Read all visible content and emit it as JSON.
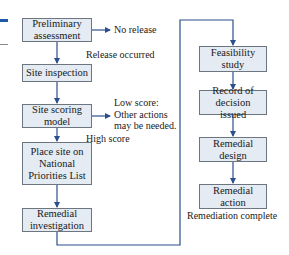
{
  "colors": {
    "box_fill": "#e4ebf2",
    "box_border": "#6d7680",
    "arrow": "#2b4f8c",
    "accent_bar": "#1f5aa6"
  },
  "flowchart": {
    "left_column": [
      {
        "id": "preliminary",
        "label": "Preliminary\nassessment"
      },
      {
        "id": "inspection",
        "label": "Site inspection"
      },
      {
        "id": "scoring",
        "label": "Site scoring\nmodel"
      },
      {
        "id": "npl",
        "label": "Place site on\nNational\nPriorities List"
      },
      {
        "id": "investigation",
        "label": "Remedial\ninvestigation"
      }
    ],
    "right_column": [
      {
        "id": "feasibility",
        "label": "Feasibility\nstudy"
      },
      {
        "id": "record",
        "label": "Record of\ndecision issued"
      },
      {
        "id": "design",
        "label": "Remedial\ndesign"
      },
      {
        "id": "action",
        "label": "Remedial\naction"
      }
    ],
    "annotations": {
      "no_release": "No release",
      "release_occurred": "Release occurred",
      "low_score": "Low score:\nOther actions\nmay be needed.",
      "high_score": "High score",
      "complete": "Remediation complete"
    }
  }
}
